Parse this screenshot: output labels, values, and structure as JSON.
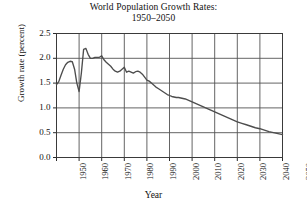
{
  "chart_data": {
    "type": "line",
    "title": "World Population Growth Rates:",
    "subtitle": "1950–2050",
    "xlabel": "Year",
    "ylabel": "Growth rate (percent)",
    "xlim": [
      1950,
      2050
    ],
    "ylim": [
      0.0,
      2.5
    ],
    "xticks": [
      1950,
      1960,
      1970,
      1980,
      1990,
      2000,
      2010,
      2020,
      2030,
      2040,
      2050
    ],
    "xtick_labels": [
      "1950",
      "1960",
      "1970",
      "1980",
      "1990",
      "2000",
      "2010",
      "2020",
      "2030",
      "2040",
      "2050"
    ],
    "yticks": [
      0.0,
      0.5,
      1.0,
      1.5,
      2.0,
      2.5
    ],
    "ytick_labels": [
      "0.0",
      "0.5",
      "1.0",
      "1.5",
      "2.0",
      "2.5"
    ],
    "grid": true,
    "legend": "none",
    "line_color": "#4d4d4d",
    "series": [
      {
        "name": "World population growth rate",
        "x": [
          1950,
          1951,
          1952,
          1953,
          1954,
          1955,
          1956,
          1957,
          1958,
          1959,
          1960,
          1961,
          1962,
          1963,
          1964,
          1965,
          1966,
          1967,
          1968,
          1969,
          1970,
          1971,
          1972,
          1973,
          1974,
          1975,
          1976,
          1977,
          1978,
          1979,
          1980,
          1981,
          1982,
          1983,
          1984,
          1985,
          1986,
          1987,
          1988,
          1989,
          1990,
          1991,
          1992,
          1993,
          1994,
          1995,
          1996,
          1997,
          1998,
          1999,
          2000,
          2001,
          2002,
          2003,
          2004,
          2005,
          2006,
          2007,
          2008,
          2009,
          2010,
          2012,
          2014,
          2016,
          2018,
          2020,
          2022,
          2024,
          2026,
          2028,
          2030,
          2032,
          2034,
          2036,
          2038,
          2040,
          2042,
          2044,
          2046,
          2048,
          2050
        ],
        "y": [
          1.47,
          1.53,
          1.66,
          1.78,
          1.87,
          1.92,
          1.94,
          1.93,
          1.78,
          1.5,
          1.33,
          1.7,
          2.18,
          2.2,
          2.08,
          2.0,
          2.0,
          2.02,
          2.02,
          2.02,
          2.05,
          1.97,
          1.92,
          1.88,
          1.84,
          1.78,
          1.74,
          1.72,
          1.74,
          1.78,
          1.82,
          1.72,
          1.74,
          1.72,
          1.7,
          1.73,
          1.74,
          1.72,
          1.68,
          1.62,
          1.56,
          1.54,
          1.5,
          1.46,
          1.42,
          1.39,
          1.36,
          1.33,
          1.3,
          1.27,
          1.25,
          1.23,
          1.22,
          1.21,
          1.21,
          1.2,
          1.19,
          1.18,
          1.16,
          1.14,
          1.12,
          1.08,
          1.04,
          1.0,
          0.96,
          0.92,
          0.88,
          0.84,
          0.8,
          0.76,
          0.72,
          0.69,
          0.66,
          0.63,
          0.6,
          0.58,
          0.55,
          0.52,
          0.5,
          0.48,
          0.46
        ]
      }
    ]
  }
}
